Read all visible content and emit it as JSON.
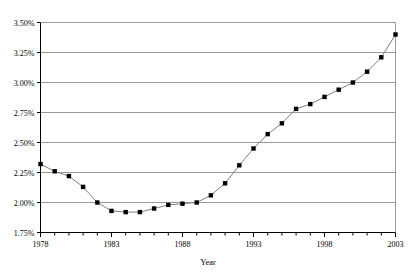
{
  "chart_data": {
    "type": "line",
    "title": "",
    "xlabel": "Year",
    "ylabel": "",
    "x": [
      1978,
      1979,
      1980,
      1981,
      1982,
      1983,
      1984,
      1985,
      1986,
      1987,
      1988,
      1989,
      1990,
      1991,
      1992,
      1993,
      1994,
      1995,
      1996,
      1997,
      1998,
      1999,
      2000,
      2001,
      2002,
      2003
    ],
    "values": [
      2.32,
      2.26,
      2.22,
      2.13,
      2.0,
      1.93,
      1.92,
      1.92,
      1.95,
      1.98,
      1.99,
      2.0,
      2.06,
      2.16,
      2.31,
      2.45,
      2.57,
      2.66,
      2.78,
      2.82,
      2.88,
      2.94,
      3.0,
      3.09,
      3.21,
      3.4
    ],
    "xlim": [
      1978,
      2003
    ],
    "ylim": [
      1.75,
      3.5
    ],
    "xticks_major": [
      1978,
      1983,
      1988,
      1993,
      1998,
      2003
    ],
    "xticks_minor_step": 1,
    "yticks": [
      1.75,
      2.0,
      2.25,
      2.5,
      2.75,
      3.0,
      3.25,
      3.5
    ],
    "ytick_labels": [
      "1.75%",
      "2.00%",
      "2.25%",
      "2.50%",
      "2.75%",
      "3.00%",
      "3.25%",
      "3.50%"
    ],
    "xtick_labels": [
      "1978",
      "1983",
      "1988",
      "1993",
      "1998",
      "2003"
    ],
    "grid": "horizontal",
    "legend": "none",
    "marker": "square",
    "colors": {
      "line": "#808080",
      "marker": "#000000",
      "gridline": "#808080",
      "axis": "#000000",
      "background": "#ffffff"
    }
  }
}
